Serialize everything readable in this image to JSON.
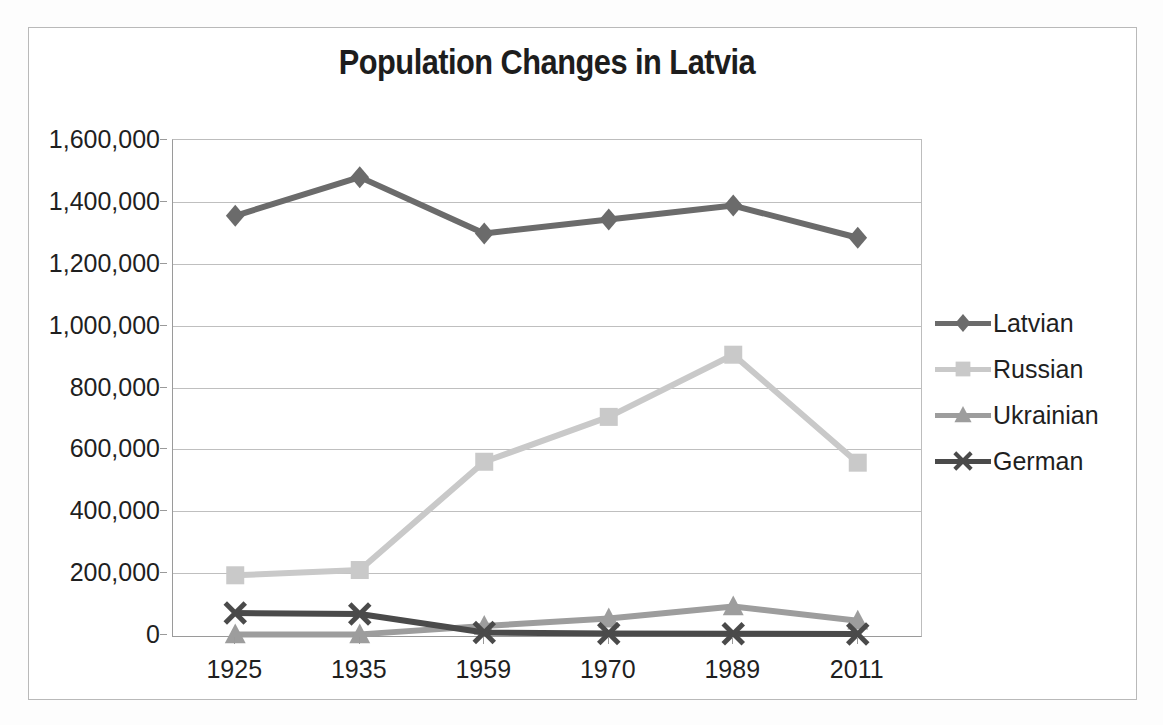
{
  "chart_data": {
    "type": "line",
    "title": "Population Changes in Latvia",
    "xlabel": "",
    "ylabel": "",
    "categories": [
      "1925",
      "1935",
      "1959",
      "1970",
      "1989",
      "2011"
    ],
    "ylim": [
      0,
      1600000
    ],
    "ytick_labels": [
      "1,600,000",
      "1,400,000",
      "1,200,000",
      "1,000,000",
      "800,000",
      "600,000",
      "400,000",
      "200,000",
      "0"
    ],
    "ytick_values": [
      1600000,
      1400000,
      1200000,
      1000000,
      800000,
      600000,
      400000,
      200000,
      0
    ],
    "grid": true,
    "legend_position": "right",
    "series": [
      {
        "name": "Latvian",
        "marker": "diamond",
        "color": "#6b6b6b",
        "values": [
          1355000,
          1480000,
          1298000,
          1343000,
          1388000,
          1284000
        ]
      },
      {
        "name": "Russian",
        "marker": "square",
        "color": "#c9c9c9",
        "values": [
          193000,
          210000,
          560000,
          705000,
          906000,
          557000
        ]
      },
      {
        "name": "Ukrainian",
        "marker": "triangle",
        "color": "#9d9d9d",
        "values": [
          2000,
          2000,
          29000,
          53000,
          92000,
          46000
        ]
      },
      {
        "name": "German",
        "marker": "cross",
        "color": "#4a4a4a",
        "values": [
          71000,
          68000,
          8000,
          5000,
          4000,
          3000
        ]
      }
    ]
  },
  "colors": {
    "latvian": "#6b6b6b",
    "russian": "#c9c9c9",
    "ukrainian": "#9d9d9d",
    "german": "#4a4a4a",
    "gridline": "#bfbfbf",
    "axis": "#9a9a9a",
    "frame": "#b9b9b9",
    "text": "#1f1f1f"
  }
}
